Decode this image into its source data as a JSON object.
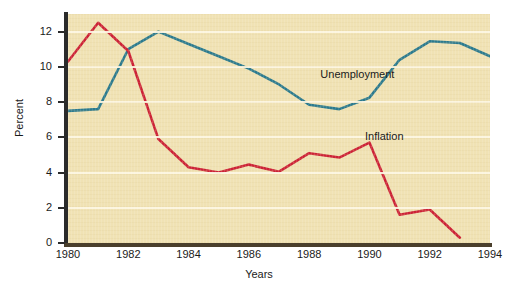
{
  "chart_data": {
    "type": "line",
    "title": "",
    "xlabel": "Years",
    "ylabel": "Percent",
    "xlim": [
      1980,
      1994
    ],
    "ylim": [
      0,
      13
    ],
    "grid": true,
    "legend_position": "inline-annotation",
    "x": [
      1980,
      1981,
      1982,
      1983,
      1984,
      1985,
      1986,
      1987,
      1988,
      1989,
      1990,
      1991,
      1992,
      1993,
      1994
    ],
    "x_tick_labels": [
      "1980",
      "1982",
      "1984",
      "1986",
      "1988",
      "1990",
      "1992",
      "1994"
    ],
    "x_tick_values": [
      1980,
      1982,
      1984,
      1986,
      1988,
      1990,
      1992,
      1994
    ],
    "y_tick_labels": [
      "0",
      "2",
      "4",
      "6",
      "8",
      "10",
      "12"
    ],
    "y_tick_values": [
      0,
      2,
      4,
      6,
      8,
      10,
      12
    ],
    "gridline_values": [
      2,
      4,
      6,
      8,
      10,
      12
    ],
    "series": [
      {
        "name": "Unemployment",
        "color": "#2b7a8e",
        "values": [
          7.5,
          7.6,
          11.0,
          12.0,
          11.3,
          10.6,
          9.9,
          9.0,
          7.85,
          7.6,
          8.25,
          10.4,
          11.45,
          11.35,
          10.6
        ]
      },
      {
        "name": "Inflation",
        "color": "#cc2236",
        "values": [
          10.3,
          12.5,
          10.9,
          5.9,
          4.3,
          4.0,
          4.45,
          4.05,
          5.1,
          4.85,
          5.7,
          1.6,
          1.9,
          0.3,
          null
        ]
      }
    ],
    "annotations": [
      {
        "text": "Unemployment",
        "x": 1989.6,
        "y": 9.55
      },
      {
        "text": "Inflation",
        "x": 1990.5,
        "y": 6.0
      }
    ],
    "colors": {
      "plot_background": "#f0e2b4",
      "gridline": "#fdf6e3",
      "axis": "#2b2b2b",
      "x_axis": "#4a3f2c",
      "text": "#1a1a1a",
      "page_background": "#ffffff"
    }
  }
}
